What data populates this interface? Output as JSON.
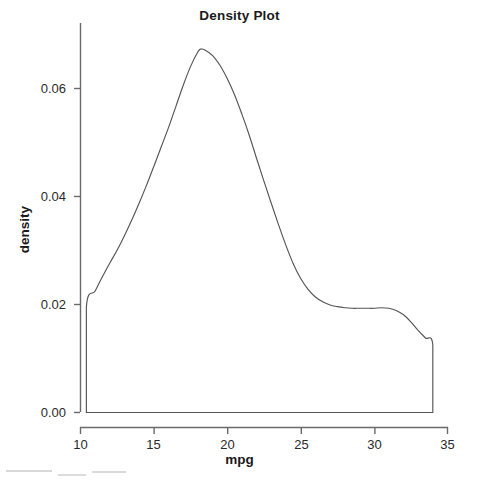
{
  "chart_data": {
    "type": "area",
    "title": "Density Plot",
    "xlabel": "mpg",
    "ylabel": "density",
    "xlim": [
      10,
      35
    ],
    "ylim": [
      0.0,
      0.07
    ],
    "xticks": [
      10,
      15,
      20,
      25,
      30,
      35
    ],
    "xtick_labels": [
      "10",
      "15",
      "20",
      "25",
      "30",
      "35"
    ],
    "yticks": [
      0.0,
      0.02,
      0.04,
      0.06
    ],
    "ytick_labels": [
      "0.00",
      "0.02",
      "0.04",
      "0.06"
    ],
    "grid": false,
    "legend": false,
    "line_color": "#555555",
    "fill_color": "#ffffff",
    "background_color": "#ffffff",
    "series": [
      {
        "name": "density",
        "x": [
          10.4,
          10.4,
          11.0,
          11.5,
          12.0,
          12.5,
          13.0,
          13.5,
          14.0,
          14.5,
          15.0,
          15.5,
          16.0,
          16.5,
          17.0,
          17.5,
          18.0,
          18.2,
          18.5,
          19.0,
          19.5,
          20.0,
          20.5,
          21.0,
          21.5,
          22.0,
          22.5,
          23.0,
          23.5,
          24.0,
          24.5,
          25.0,
          25.5,
          26.0,
          26.5,
          27.0,
          27.5,
          28.0,
          28.5,
          29.0,
          29.5,
          30.0,
          30.5,
          31.0,
          31.5,
          32.0,
          32.5,
          33.0,
          33.5,
          34.0,
          34.0
        ],
        "y": [
          0.0,
          0.0195,
          0.0225,
          0.0252,
          0.0277,
          0.0301,
          0.0328,
          0.0357,
          0.0388,
          0.0421,
          0.0456,
          0.0492,
          0.0528,
          0.0567,
          0.0606,
          0.0641,
          0.0668,
          0.0673,
          0.0671,
          0.0661,
          0.0643,
          0.0618,
          0.0588,
          0.0552,
          0.0513,
          0.047,
          0.0428,
          0.0387,
          0.0347,
          0.0309,
          0.0275,
          0.0248,
          0.0228,
          0.0214,
          0.0205,
          0.0199,
          0.0196,
          0.0194,
          0.0193,
          0.0193,
          0.0193,
          0.0193,
          0.0194,
          0.0193,
          0.0189,
          0.0181,
          0.0168,
          0.0152,
          0.0138,
          0.0125,
          0.0
        ]
      }
    ],
    "annotations": {
      "peak_x": 18.2,
      "peak_y": 0.0673,
      "left_edge_x": 10.4,
      "left_edge_y": 0.0195,
      "right_edge_x": 34.0,
      "right_edge_y": 0.0125,
      "shoulder_x": 30.0,
      "shoulder_y": 0.0193
    }
  },
  "axes": {
    "title": "Density Plot",
    "x_label": "mpg",
    "y_label": "density"
  }
}
